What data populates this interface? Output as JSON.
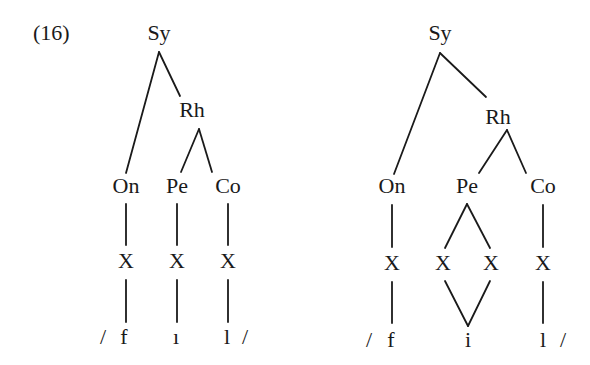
{
  "example_number": "(16)",
  "trees": [
    {
      "id": "left",
      "nodes": {
        "root": "Sy",
        "rhyme": "Rh",
        "onset": "On",
        "peak": "Pe",
        "coda": "Co",
        "x_onset": "X",
        "x_peak": "X",
        "x_coda": "X"
      },
      "segments": {
        "open_slash": "/",
        "onset_seg": "f",
        "peak_seg": "ı",
        "coda_seg": "l",
        "close_slash": "/"
      }
    },
    {
      "id": "right",
      "nodes": {
        "root": "Sy",
        "rhyme": "Rh",
        "onset": "On",
        "peak": "Pe",
        "coda": "Co",
        "x_onset": "X",
        "x_peak_1": "X",
        "x_peak_2": "X",
        "x_coda": "X"
      },
      "segments": {
        "open_slash": "/",
        "onset_seg": "f",
        "peak_seg": "i",
        "coda_seg": "l",
        "close_slash": "/"
      }
    }
  ]
}
